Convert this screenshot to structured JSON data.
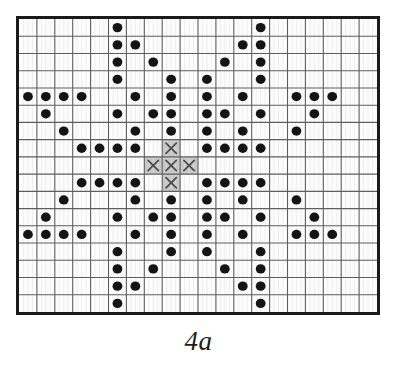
{
  "figure": {
    "caption": "4a",
    "title": "4a",
    "colors": {
      "frame": "#1a1a1a",
      "grid_line": "#5e5e5e",
      "cell_background": "#fcfcfc",
      "dot": "#141414",
      "x_mark": "#4a4a4a",
      "x_cell_background": "#c8c8c8",
      "caption_text": "#1d1d1d",
      "page_background": "#ffffff"
    }
  },
  "chart_data": {
    "type": "heatmap",
    "title": "4a",
    "xlabel": "",
    "ylabel": "",
    "grid": true,
    "legend_position": "none",
    "columns": 20,
    "rows": 17,
    "cell_size_px": 17.9,
    "symbols": {
      "dot": "filled circle",
      "x": "cross mark on shaded cell",
      "empty": "blank cell"
    },
    "x": [
      0,
      1,
      2,
      3,
      4,
      5,
      6,
      7,
      8,
      9,
      10,
      11,
      12,
      13,
      14,
      15,
      16,
      17,
      18,
      19
    ],
    "y": [
      0,
      1,
      2,
      3,
      4,
      5,
      6,
      7,
      8,
      9,
      10,
      11,
      12,
      13,
      14,
      15,
      16
    ],
    "dot_cells": [
      [
        1,
        6
      ],
      [
        1,
        14
      ],
      [
        2,
        6
      ],
      [
        2,
        7
      ],
      [
        2,
        13
      ],
      [
        2,
        14
      ],
      [
        3,
        6
      ],
      [
        3,
        8
      ],
      [
        3,
        12
      ],
      [
        3,
        14
      ],
      [
        4,
        6
      ],
      [
        4,
        9
      ],
      [
        4,
        11
      ],
      [
        4,
        14
      ],
      [
        5,
        1
      ],
      [
        5,
        2
      ],
      [
        5,
        3
      ],
      [
        5,
        4
      ],
      [
        5,
        7
      ],
      [
        5,
        9
      ],
      [
        5,
        11
      ],
      [
        5,
        13
      ],
      [
        5,
        16
      ],
      [
        5,
        17
      ],
      [
        5,
        18
      ],
      [
        6,
        2
      ],
      [
        6,
        6
      ],
      [
        6,
        8
      ],
      [
        6,
        9
      ],
      [
        6,
        11
      ],
      [
        6,
        12
      ],
      [
        6,
        14
      ],
      [
        6,
        17
      ],
      [
        7,
        3
      ],
      [
        7,
        7
      ],
      [
        7,
        9
      ],
      [
        7,
        11
      ],
      [
        7,
        13
      ],
      [
        7,
        16
      ],
      [
        8,
        4
      ],
      [
        8,
        5
      ],
      [
        8,
        6
      ],
      [
        8,
        7
      ],
      [
        8,
        11
      ],
      [
        8,
        12
      ],
      [
        8,
        13
      ],
      [
        8,
        14
      ],
      [
        10,
        4
      ],
      [
        10,
        5
      ],
      [
        10,
        6
      ],
      [
        10,
        7
      ],
      [
        10,
        11
      ],
      [
        10,
        12
      ],
      [
        10,
        13
      ],
      [
        10,
        14
      ],
      [
        11,
        3
      ],
      [
        11,
        7
      ],
      [
        11,
        9
      ],
      [
        11,
        11
      ],
      [
        11,
        13
      ],
      [
        11,
        16
      ],
      [
        12,
        2
      ],
      [
        12,
        6
      ],
      [
        12,
        8
      ],
      [
        12,
        9
      ],
      [
        12,
        11
      ],
      [
        12,
        12
      ],
      [
        12,
        14
      ],
      [
        12,
        17
      ],
      [
        13,
        1
      ],
      [
        13,
        2
      ],
      [
        13,
        3
      ],
      [
        13,
        4
      ],
      [
        13,
        7
      ],
      [
        13,
        9
      ],
      [
        13,
        11
      ],
      [
        13,
        13
      ],
      [
        13,
        16
      ],
      [
        13,
        17
      ],
      [
        13,
        18
      ],
      [
        14,
        6
      ],
      [
        14,
        9
      ],
      [
        14,
        11
      ],
      [
        14,
        14
      ],
      [
        15,
        6
      ],
      [
        15,
        8
      ],
      [
        15,
        12
      ],
      [
        15,
        14
      ],
      [
        16,
        6
      ],
      [
        16,
        7
      ],
      [
        16,
        13
      ],
      [
        16,
        14
      ],
      [
        17,
        6
      ],
      [
        17,
        14
      ]
    ],
    "x_cells": [
      [
        8,
        9
      ],
      [
        9,
        8
      ],
      [
        9,
        9
      ],
      [
        9,
        10
      ],
      [
        10,
        9
      ]
    ],
    "counts": {
      "dots": 96,
      "x_marks": 5
    }
  }
}
